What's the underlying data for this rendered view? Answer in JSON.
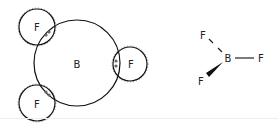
{
  "diagram": {
    "overlap_diagram": {
      "central_atom": {
        "symbol": "B"
      },
      "outer_atoms": [
        {
          "symbol": "F",
          "position": "top-left",
          "shared_electrons": 2
        },
        {
          "symbol": "F",
          "position": "right",
          "shared_electrons": 2
        },
        {
          "symbol": "F",
          "position": "bottom-left",
          "shared_electrons": 2
        }
      ]
    },
    "structural_formula": {
      "central": "B",
      "substituents": [
        {
          "symbol": "F",
          "bond": "dashed",
          "position": "upper-left"
        },
        {
          "symbol": "F",
          "bond": "single",
          "position": "right"
        },
        {
          "symbol": "F",
          "bond": "wedge",
          "position": "lower-left"
        }
      ]
    }
  }
}
